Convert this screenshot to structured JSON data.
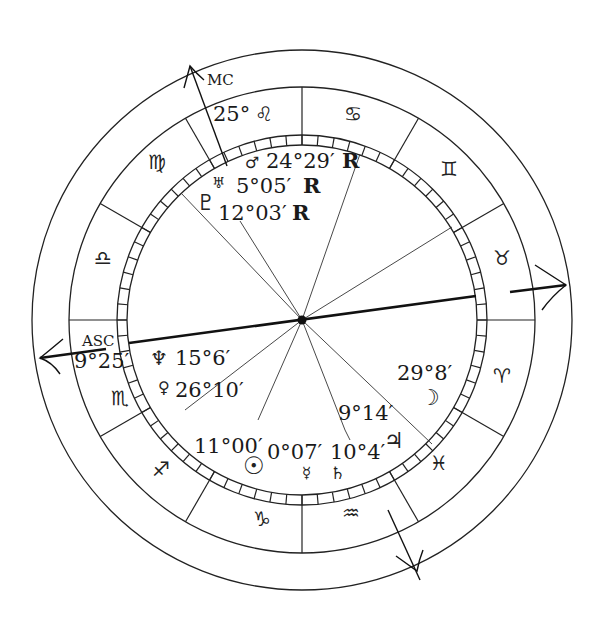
{
  "chart": {
    "angles": {
      "mc_label": "MC",
      "mc_degree": "25°",
      "mc_sign_glyph": "♌",
      "asc_label": "ASC",
      "asc_degree": "9°25′"
    },
    "signs": [
      {
        "name": "Taurus",
        "glyph": "♉"
      },
      {
        "name": "Gemini",
        "glyph": "♊"
      },
      {
        "name": "Cancer",
        "glyph": "♋"
      },
      {
        "name": "Leo",
        "glyph": "♌"
      },
      {
        "name": "Virgo",
        "glyph": "♍"
      },
      {
        "name": "Libra",
        "glyph": "♎"
      },
      {
        "name": "Scorpio",
        "glyph": "♏"
      },
      {
        "name": "Sagittarius",
        "glyph": "♐"
      },
      {
        "name": "Capricorn",
        "glyph": "♑"
      },
      {
        "name": "Aquarius",
        "glyph": "♒"
      },
      {
        "name": "Pisces",
        "glyph": "♓"
      },
      {
        "name": "Aries",
        "glyph": "♈"
      }
    ],
    "planets": [
      {
        "name": "Mars",
        "glyph": "♂",
        "position": "24°29′",
        "retro": "R"
      },
      {
        "name": "Uranus",
        "glyph": "♅",
        "position": "5°05′",
        "retro": "R"
      },
      {
        "name": "Pluto",
        "glyph": "♇",
        "position": "12°03′",
        "retro": "R"
      },
      {
        "name": "Neptune",
        "glyph": "♆",
        "position": "15°6′"
      },
      {
        "name": "Venus",
        "glyph": "♀",
        "position": "26°10′"
      },
      {
        "name": "Sun",
        "glyph": "☉",
        "position": "11°00′"
      },
      {
        "name": "Mercury",
        "glyph": "☿",
        "position": "0°07′"
      },
      {
        "name": "Saturn",
        "glyph": "♄",
        "position": "10°4′"
      },
      {
        "name": "Jupiter",
        "glyph": "♃",
        "position": "9°14′"
      },
      {
        "name": "Moon",
        "glyph": "☽",
        "position": "29°8′"
      }
    ]
  }
}
